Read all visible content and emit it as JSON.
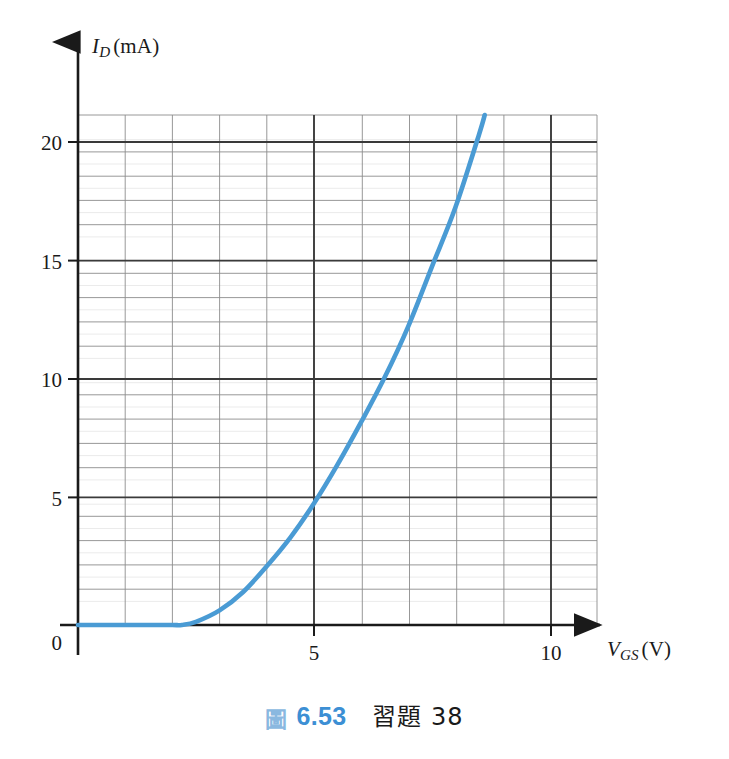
{
  "figure": {
    "caption_glyph": "圖",
    "caption_number": "6.53",
    "caption_text": "習題 38"
  },
  "colors": {
    "curve": "#4a9bd4",
    "major_grid": "#3a3a3a",
    "minor_grid": "#8c8c8c",
    "fine_grid": "#cfcfcf",
    "axis": "#1a1a1a",
    "caption_number": "#3c8fd4",
    "caption_glyph": "#8ab8e0",
    "background": "#ffffff"
  },
  "axes": {
    "y_label_var": "I",
    "y_label_sub": "D",
    "y_label_unit": "(mA)",
    "x_label_var": "V",
    "x_label_sub": "GS",
    "x_label_unit": "(V)",
    "origin_label": "0",
    "y_ticks": [
      "5",
      "10",
      "15",
      "20"
    ],
    "x_ticks": [
      "5",
      "10"
    ]
  },
  "chart_data": {
    "type": "line",
    "xlabel": "V_GS (V)",
    "ylabel": "I_D (mA)",
    "xlim": [
      0,
      11
    ],
    "ylim": [
      0,
      21
    ],
    "xticks": [
      0,
      5,
      10
    ],
    "yticks": [
      0,
      5,
      10,
      15,
      20
    ],
    "minor_tick_step_x": 1,
    "minor_tick_step_y": 1,
    "major_grid_step_x": 5,
    "major_grid_step_y": 5,
    "grid": true,
    "legend": false,
    "series": [
      {
        "name": "I_D vs V_GS transfer characteristic",
        "color": "#4a9bd4",
        "threshold_voltage": 2.2,
        "x": [
          0.0,
          0.5,
          1.0,
          1.5,
          2.0,
          2.2,
          2.5,
          3.0,
          3.5,
          4.0,
          4.5,
          5.0,
          5.5,
          6.0,
          6.5,
          7.0,
          7.5,
          8.0,
          8.5,
          8.62
        ],
        "y": [
          0.0,
          0.0,
          0.0,
          0.0,
          0.0,
          0.0,
          0.13,
          0.6,
          1.36,
          2.42,
          3.6,
          5.0,
          6.6,
          8.35,
          10.2,
          12.3,
          14.75,
          17.2,
          20.2,
          21.0
        ]
      }
    ]
  }
}
